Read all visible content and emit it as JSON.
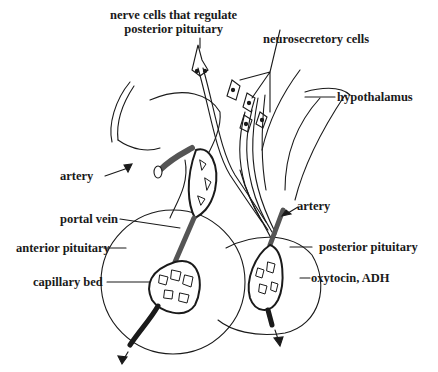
{
  "diagram": {
    "labels": {
      "nerve_cells_line1": "nerve cells that regulate",
      "nerve_cells_line2": "posterior pituitary",
      "neurosecretory": "neurosecretory cells",
      "hypothalamus": "hypothalamus",
      "artery_left": "artery",
      "portal_vein": "portal vein",
      "anterior_pituitary": "anterior pituitary",
      "capillary_bed": "capillary bed",
      "artery_right": "artery",
      "posterior_pituitary": "posterior pituitary",
      "hormones": "oxytocin, ADH"
    },
    "colors": {
      "ink": "#1a1a1a",
      "background": "#ffffff",
      "vessel_fill": "#555555"
    }
  }
}
